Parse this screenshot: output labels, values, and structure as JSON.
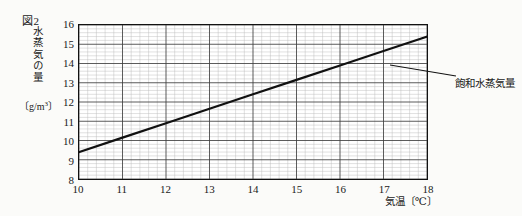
{
  "figure": {
    "number_label": "図2",
    "y_axis_title": "水蒸気の量",
    "y_axis_unit": "〔g/m3〕",
    "x_axis_label": "気温〔℃〕",
    "annotation_label": "飽和水蒸気量"
  },
  "chart_data": {
    "type": "line",
    "title": "図2",
    "xlabel": "気温〔℃〕",
    "ylabel": "水蒸気の量〔g/m3〕",
    "xlim": [
      10,
      18
    ],
    "ylim": [
      8,
      16
    ],
    "xticks": [
      "10",
      "11",
      "12",
      "13",
      "14",
      "15",
      "16",
      "17",
      "18"
    ],
    "yticks": [
      "8",
      "9",
      "10",
      "11",
      "12",
      "13",
      "14",
      "15",
      "16"
    ],
    "grid": "minor-grid-5-divisions-per-major-cell",
    "legend_position": "annotation-right",
    "series": [
      {
        "name": "飽和水蒸気量",
        "x": [
          10,
          11,
          12,
          13,
          14,
          15,
          16,
          17,
          18
        ],
        "values": [
          9.4,
          10.15,
          10.9,
          11.65,
          12.4,
          13.15,
          13.9,
          14.65,
          15.4
        ],
        "color": "#111111"
      }
    ],
    "annotations": [
      {
        "text": "飽和水蒸気量",
        "points_to_x": 16.6,
        "points_to_y": 14.1
      }
    ]
  }
}
